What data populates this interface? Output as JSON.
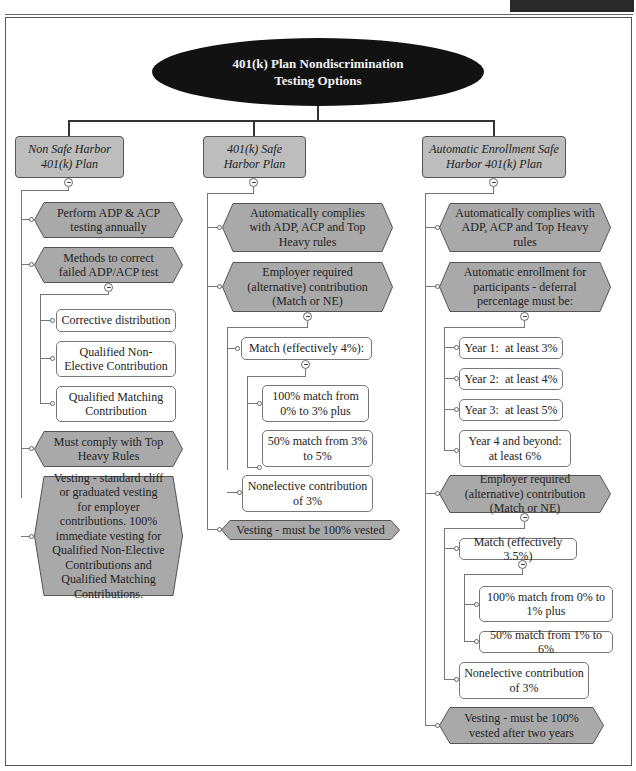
{
  "title": "401(k) Plan Nondiscrimination Testing Options",
  "title_lines": [
    "401(k) Plan Nondiscrimination",
    "Testing Options"
  ],
  "colors": {
    "ellipse": "#121212",
    "header_fill": "#bdbdbd",
    "hex_fill": "#a9a9a9",
    "box_fill": "#ffffff",
    "line": "#333333"
  },
  "columns": [
    {
      "header": [
        "Non Safe Harbor",
        "401(k) Plan"
      ],
      "items": [
        {
          "type": "hex",
          "text": "Perform ADP & ACP testing annually"
        },
        {
          "type": "hex",
          "text": "Methods to correct failed ADP/ACP test",
          "children": [
            {
              "type": "box",
              "text": "Corrective distribution"
            },
            {
              "type": "box",
              "text": "Qualified Non-Elective Contribution"
            },
            {
              "type": "box",
              "text": "Qualified Matching Contribution"
            }
          ]
        },
        {
          "type": "hex",
          "text": "Must comply with Top Heavy Rules"
        },
        {
          "type": "hex",
          "text": "Vesting - standard cliff or graduated vesting for employer contributions. 100% immediate vesting for Qualified Non-Elective Contributions and Qualified Matching Contributions."
        }
      ]
    },
    {
      "header": [
        "401(k) Safe",
        "Harbor Plan"
      ],
      "items": [
        {
          "type": "hex",
          "text": "Automatically complies with ADP, ACP and Top Heavy rules"
        },
        {
          "type": "hex",
          "text": "Employer required (alternative) contribution (Match or NE)",
          "children": [
            {
              "type": "box",
              "text": "Match (effectively 4%):",
              "children": [
                {
                  "type": "box",
                  "text": "100% match from 0% to 3% plus"
                },
                {
                  "type": "box",
                  "text": "50% match from 3% to 5%"
                }
              ]
            },
            {
              "type": "box",
              "text": "Nonelective contribution of 3%"
            }
          ]
        },
        {
          "type": "hex",
          "text": "Vesting - must be 100% vested"
        }
      ]
    },
    {
      "header": [
        "Automatic Enrollment Safe",
        "Harbor 401(k) Plan"
      ],
      "items": [
        {
          "type": "hex",
          "text": "Automatically complies with ADP, ACP and Top Heavy rules"
        },
        {
          "type": "hex",
          "text": "Automatic enrollment for participants - deferral percentage must be:",
          "children": [
            {
              "type": "box",
              "text": "Year 1:  at least 3%"
            },
            {
              "type": "box",
              "text": "Year 2:  at least 4%"
            },
            {
              "type": "box",
              "text": "Year 3:  at least 5%"
            },
            {
              "type": "box",
              "text": "Year 4 and beyond: at least 6%"
            }
          ]
        },
        {
          "type": "hex",
          "text": "Employer required (alternative) contribution (Match or NE)",
          "children": [
            {
              "type": "box",
              "text": "Match (effectively 3.5%)",
              "children": [
                {
                  "type": "box",
                  "text": "100% match from 0% to 1% plus"
                },
                {
                  "type": "box",
                  "text": "50% match from 1% to 6%"
                }
              ]
            },
            {
              "type": "box",
              "text": "Nonelective contribution of 3%"
            }
          ]
        },
        {
          "type": "hex",
          "text": "Vesting - must be 100% vested after two years"
        }
      ]
    }
  ]
}
